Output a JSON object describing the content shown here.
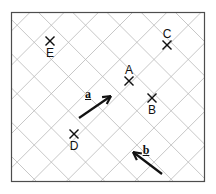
{
  "figure": {
    "background_color": "#ffffff",
    "border": {
      "color": "#4d4d4d",
      "x": 11,
      "y": 12,
      "width": 194,
      "height": 170
    },
    "grid": {
      "type": "diagonal-lattice",
      "color": "#b9b9b9",
      "line_width": 0.8,
      "spacing": 24.2,
      "orientation_degrees": 45
    },
    "marker": {
      "glyph": "x",
      "color": "#111111",
      "size": 9
    },
    "points": [
      {
        "id": "E",
        "label": "E",
        "x": 50,
        "y": 41,
        "label_x": 50,
        "label_y": 53,
        "label_position": "below"
      },
      {
        "id": "C",
        "label": "C",
        "x": 167,
        "y": 45,
        "label_x": 167,
        "label_y": 34,
        "label_position": "above"
      },
      {
        "id": "A",
        "label": "A",
        "x": 129,
        "y": 81,
        "label_x": 129,
        "label_y": 70,
        "label_position": "above"
      },
      {
        "id": "B",
        "label": "B",
        "x": 152,
        "y": 98,
        "label_x": 152,
        "label_y": 110,
        "label_position": "below"
      },
      {
        "id": "D",
        "label": "D",
        "x": 74,
        "y": 134,
        "label_x": 74,
        "label_y": 146,
        "label_position": "below"
      }
    ],
    "vectors": [
      {
        "id": "a",
        "label": "a",
        "underlined": true,
        "color": "#111111",
        "line_width": 2.2,
        "tail_x": 79,
        "tail_y": 118,
        "head_x": 111,
        "head_y": 96,
        "direction": "north-east",
        "label_x": 88,
        "label_y": 94
      },
      {
        "id": "b",
        "label": "b",
        "underlined": true,
        "color": "#111111",
        "line_width": 2.2,
        "tail_x": 162,
        "tail_y": 174,
        "head_x": 133,
        "head_y": 152,
        "direction": "south-west",
        "label_x": 146,
        "label_y": 150
      }
    ]
  }
}
